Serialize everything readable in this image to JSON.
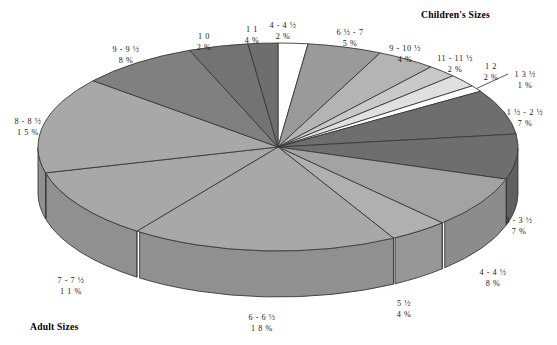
{
  "headers": {
    "children": "Children's Sizes",
    "adult": "Adult Sizes"
  },
  "chart_data": {
    "type": "pie",
    "title": "",
    "subtitle": "",
    "xlabel": "",
    "ylabel": "",
    "grid": false,
    "legend_position": "none",
    "three_d": true,
    "group_headers": [
      "Children's Sizes",
      "Adult Sizes"
    ],
    "value_suffix": "%",
    "categories": [
      "4 - 4 ½",
      "6 ½ - 7",
      "9 - 10 ½",
      "11 - 11 ½",
      "1 2",
      "1 3 ½",
      "1 ½ - 2 ½",
      "3 - 3 ½",
      "4 - 4 ½",
      "5 ½",
      "6 - 6 ½",
      "7 - 7 ½",
      "8 - 8 ½",
      "9 - 9 ½",
      "1 1",
      "1 0"
    ],
    "values": [
      2,
      5,
      4,
      2,
      2,
      1,
      7,
      7,
      8,
      4,
      18,
      11,
      15,
      8,
      4,
      2
    ],
    "colors": [
      "#ffffff",
      "#9a9a9a",
      "#b4b4b4",
      "#c9c9c9",
      "#e0e0e0",
      "#ffffff",
      "#6e6e6e",
      "#6e6e6e",
      "#a3a3a3",
      "#b0b0b0",
      "#a8a8a8",
      "#a8a8a8",
      "#a8a8a8",
      "#808080",
      "#737373",
      "#6e6e6e"
    ],
    "slices": [
      {
        "label": "4 - 4 ½",
        "value": 2,
        "percent_text": "2 %",
        "group": "Children's Sizes"
      },
      {
        "label": "6 ½ - 7",
        "value": 5,
        "percent_text": "5 %",
        "group": "Children's Sizes"
      },
      {
        "label": "9 - 10 ½",
        "value": 4,
        "percent_text": "4 %",
        "group": "Children's Sizes"
      },
      {
        "label": "11 - 11 ½",
        "value": 2,
        "percent_text": "2 %",
        "group": "Children's Sizes"
      },
      {
        "label": "1 2",
        "value": 2,
        "percent_text": "2 %",
        "group": "Children's Sizes"
      },
      {
        "label": "1 3 ½",
        "value": 1,
        "percent_text": "1 %",
        "group": "Children's Sizes"
      },
      {
        "label": "1 ½ - 2 ½",
        "value": 7,
        "percent_text": "7 %",
        "group": "Adult Sizes"
      },
      {
        "label": "3 - 3 ½",
        "value": 7,
        "percent_text": "7 %",
        "group": "Adult Sizes"
      },
      {
        "label": "4 - 4 ½",
        "value": 8,
        "percent_text": "8 %",
        "group": "Adult Sizes"
      },
      {
        "label": "5 ½",
        "value": 4,
        "percent_text": "4 %",
        "group": "Adult Sizes"
      },
      {
        "label": "6 - 6 ½",
        "value": 18,
        "percent_text": "1 8 %",
        "group": "Adult Sizes"
      },
      {
        "label": "7 - 7 ½",
        "value": 11,
        "percent_text": "1 1 %",
        "group": "Adult Sizes"
      },
      {
        "label": "8 - 8 ½",
        "value": 15,
        "percent_text": "1 5 %",
        "group": "Adult Sizes"
      },
      {
        "label": "9 - 9 ½",
        "value": 8,
        "percent_text": "8 %",
        "group": "Adult Sizes"
      },
      {
        "label": "1 1",
        "value": 4,
        "percent_text": "4 %",
        "group": "Adult Sizes"
      },
      {
        "label": "1 0",
        "value": 2,
        "percent_text": "2 %",
        "group": "Adult Sizes"
      }
    ],
    "total": 100
  },
  "labels": [
    {
      "name": "label-4-4half-children",
      "key": "4 - 4 ½",
      "value": "2 %",
      "x": 283,
      "y": 21
    },
    {
      "name": "label-6half-7",
      "key": "6 ½ - 7",
      "value": "5 %",
      "x": 350,
      "y": 28
    },
    {
      "name": "label-9-10half",
      "key": "9 - 10 ½",
      "value": "4 %",
      "x": 405,
      "y": 44
    },
    {
      "name": "label-11-11half",
      "key": "11 - 11 ½",
      "value": "2 %",
      "x": 455,
      "y": 54
    },
    {
      "name": "label-12",
      "key": "1 2",
      "value": "2 %",
      "x": 491,
      "y": 62
    },
    {
      "name": "label-13half",
      "key": "1 3 ½",
      "value": "1 %",
      "x": 525,
      "y": 70
    },
    {
      "name": "label-1half-2half",
      "key": "1 ½ - 2 ½",
      "value": "7 %",
      "x": 525,
      "y": 108
    },
    {
      "name": "label-3-3half",
      "key": "3 - 3 ½",
      "value": "7 %",
      "x": 519,
      "y": 216
    },
    {
      "name": "label-4-4half-adult",
      "key": "4 - 4 ½",
      "value": "8 %",
      "x": 493,
      "y": 268
    },
    {
      "name": "label-5half",
      "key": "5 ½",
      "value": "4 %",
      "x": 404,
      "y": 299
    },
    {
      "name": "label-6-6half",
      "key": "6 - 6 ½",
      "value": "1 8 %",
      "x": 262,
      "y": 313
    },
    {
      "name": "label-7-7half",
      "key": "7 - 7 ½",
      "value": "1 1 %",
      "x": 71,
      "y": 276
    },
    {
      "name": "label-8-8half",
      "key": "8 - 8 ½",
      "value": "1 5 %",
      "x": 28,
      "y": 117
    },
    {
      "name": "label-9-9half",
      "key": "9 - 9 ½",
      "value": "8 %",
      "x": 126,
      "y": 45
    },
    {
      "name": "label-10",
      "key": "1 0",
      "value": "2 %",
      "x": 204,
      "y": 32
    },
    {
      "name": "label-11",
      "key": "1 1",
      "value": "4 %",
      "x": 252,
      "y": 25
    }
  ]
}
